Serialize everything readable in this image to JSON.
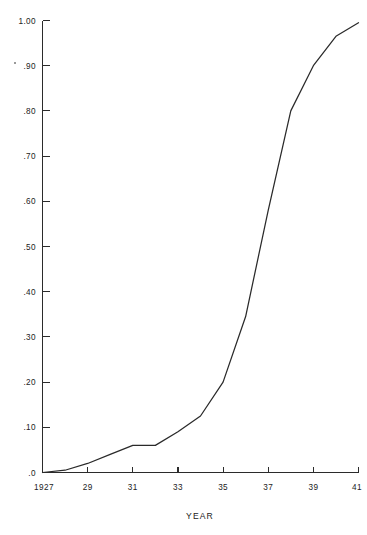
{
  "chart_data": {
    "type": "line",
    "title": "",
    "subtitle": "",
    "xlabel": "YEAR",
    "ylabel": "",
    "xlim": [
      1927,
      1941
    ],
    "ylim": [
      0.0,
      1.0
    ],
    "grid": false,
    "legend": null,
    "x_tick_labels": [
      "1927",
      "29",
      "31",
      "33",
      "35",
      "37",
      "39",
      "41"
    ],
    "x_tick_values": [
      1927,
      1929,
      1931,
      1933,
      1935,
      1937,
      1939,
      1941
    ],
    "y_tick_labels": [
      ".0",
      ".10",
      ".20",
      ".30",
      ".40",
      ".50",
      ".60",
      ".70",
      ".80",
      ".90",
      "1.00"
    ],
    "y_tick_values": [
      0.0,
      0.1,
      0.2,
      0.3,
      0.4,
      0.5,
      0.6,
      0.7,
      0.8,
      0.9,
      1.0
    ],
    "series": [
      {
        "name": "cumulative proportion",
        "x": [
          1927,
          1928,
          1929,
          1930,
          1931,
          1932,
          1933,
          1934,
          1935,
          1936,
          1937,
          1938,
          1939,
          1940,
          1941
        ],
        "values": [
          0.0,
          0.005,
          0.02,
          0.04,
          0.06,
          0.06,
          0.09,
          0.125,
          0.2,
          0.345,
          0.58,
          0.8,
          0.9,
          0.965,
          0.995
        ]
      }
    ],
    "annotations": []
  },
  "axis_titles": {
    "x": "YEAR"
  }
}
